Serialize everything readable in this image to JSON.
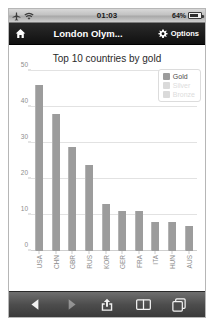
{
  "status_bar": {
    "airplane_icon": "airplane-icon",
    "wifi_icon": "wifi-icon",
    "time": "01:03",
    "battery_percent": "64%",
    "battery_level": 64,
    "battery_icon": "battery-icon"
  },
  "nav_bar": {
    "home_icon": "home-icon",
    "title": "London Olym...",
    "gear_icon": "gear-icon",
    "options_label": "Options"
  },
  "chart_data": {
    "type": "bar",
    "title": "Top 10 countries by gold",
    "categories": [
      "USA",
      "CHN",
      "GBR",
      "RUS",
      "KOR",
      "GER",
      "FRA",
      "ITA",
      "HUN",
      "AUS"
    ],
    "values": [
      46,
      38,
      29,
      24,
      13,
      11,
      11,
      8,
      8,
      7
    ],
    "series": [
      {
        "name": "Gold",
        "values": [
          46,
          38,
          29,
          24,
          13,
          11,
          11,
          8,
          8,
          7
        ],
        "active": true
      }
    ],
    "xlabel": "",
    "ylabel": "",
    "ylim": [
      0,
      50
    ],
    "yticks": [
      0,
      10,
      20,
      30,
      40,
      50
    ],
    "grid": true,
    "legend_position": "top-right",
    "legend": [
      {
        "label": "Gold",
        "enabled": true
      },
      {
        "label": "Silver",
        "enabled": false
      },
      {
        "label": "Bronze",
        "enabled": false
      }
    ],
    "bar_color": "#9c9c9c",
    "grid_color": "#e2e2e2"
  },
  "toolbar": {
    "back_label": "Back",
    "back_icon": "back-arrow-icon",
    "back_enabled": true,
    "forward_label": "Forward",
    "forward_icon": "forward-arrow-icon",
    "forward_enabled": false,
    "share_label": "Share",
    "share_icon": "share-icon",
    "bookmarks_label": "Bookmarks",
    "bookmarks_icon": "book-icon",
    "tabs_label": "Tabs",
    "tabs_icon": "tabs-icon"
  }
}
